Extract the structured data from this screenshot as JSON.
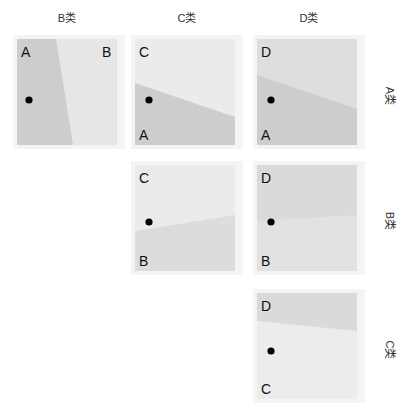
{
  "columns": [
    {
      "label": "B类"
    },
    {
      "label": "C类"
    },
    {
      "label": "D类"
    }
  ],
  "rows": [
    {
      "label": "A类"
    },
    {
      "label": "B类"
    },
    {
      "label": "C类"
    }
  ],
  "colors": {
    "dark_region": "#cdcdcd",
    "light_region": "#e6e6e6",
    "mid_region": "#d9d9d9",
    "panel_border": "#f4f4f4",
    "point": "#000000"
  },
  "panels": [
    {
      "row": 0,
      "col": 0,
      "top_left": "A",
      "top_right": "B",
      "regions": [
        "A",
        "B"
      ],
      "boundary": "steep line from top-center-left to bottom-center"
    },
    {
      "row": 0,
      "col": 1,
      "top_left": "C",
      "bottom_left": "A",
      "regions": [
        "C",
        "A"
      ],
      "boundary": "line descending from left to right"
    },
    {
      "row": 0,
      "col": 2,
      "top_left": "D",
      "bottom_left": "A",
      "regions": [
        "D",
        "A"
      ],
      "boundary": "line descending from left to right"
    },
    {
      "row": 1,
      "col": 1,
      "top_left": "C",
      "bottom_left": "B",
      "regions": [
        "C",
        "B"
      ],
      "boundary": "line ascending from left to right"
    },
    {
      "row": 1,
      "col": 2,
      "top_left": "D",
      "bottom_left": "B",
      "regions": [
        "D",
        "B"
      ],
      "boundary": "nearly flat line"
    },
    {
      "row": 2,
      "col": 2,
      "top_left": "D",
      "bottom_left": "C",
      "regions": [
        "D",
        "C"
      ],
      "boundary": "line descending from left to right"
    }
  ]
}
